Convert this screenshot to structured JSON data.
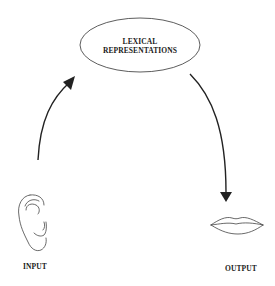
{
  "diagram": {
    "type": "cycle-flow",
    "central_node": {
      "line1": "LEXICAL",
      "line2": "REPRESENTATIONS",
      "shape": "ellipse"
    },
    "input_node": {
      "label": "INPUT",
      "icon": "ear-icon"
    },
    "output_node": {
      "label": "OUTPUT",
      "icon": "lips-icon"
    },
    "edges": [
      {
        "from": "INPUT",
        "to": "LEXICAL REPRESENTATIONS",
        "style": "curved-arrow"
      },
      {
        "from": "LEXICAL REPRESENTATIONS",
        "to": "OUTPUT",
        "style": "curved-arrow"
      }
    ],
    "colors": {
      "stroke": "#222222",
      "background": "#ffffff",
      "text": "#1a1a1a"
    }
  }
}
